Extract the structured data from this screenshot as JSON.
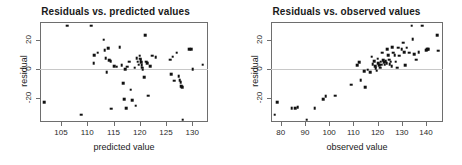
{
  "figure": {
    "background": "#ffffff",
    "point_color": "#111111",
    "frame_color": "#6e6e6e",
    "zero_line_color": "#c8c8c8"
  },
  "chart_data": [
    {
      "type": "scatter",
      "title": "Residuals vs. predicted values",
      "xlabel": "predicted value",
      "ylabel": "residual",
      "xlim": [
        101,
        133
      ],
      "ylim": [
        -36,
        32
      ],
      "xticks": [
        105,
        110,
        115,
        120,
        125,
        130
      ],
      "yticks": [
        20,
        0,
        -20
      ],
      "grid": false,
      "legend": "none",
      "annotations": [
        "horizontal reference line at residual = 0"
      ],
      "x": [
        101.8,
        106.2,
        108.9,
        110.8,
        111.2,
        111.3,
        112.0,
        113.1,
        113.3,
        113.5,
        113.7,
        114.0,
        114.2,
        114.5,
        114.6,
        115.1,
        115.6,
        116.2,
        116.6,
        116.8,
        117.0,
        117.2,
        117.4,
        117.6,
        118.0,
        118.3,
        118.6,
        119.0,
        119.2,
        119.4,
        119.6,
        119.8,
        120.0,
        120.1,
        120.2,
        120.3,
        120.4,
        120.5,
        120.6,
        120.8,
        121.0,
        121.2,
        121.4,
        121.6,
        122.0,
        122.4,
        123.0,
        125.8,
        126.0,
        126.3,
        126.6,
        127.0,
        127.4,
        127.6,
        127.8,
        127.9,
        128.0,
        128.1,
        128.2,
        129.4,
        129.8,
        130.1,
        132.0
      ],
      "y": [
        -22.5,
        29.5,
        -31.0,
        29.5,
        4.0,
        9.5,
        11.0,
        20.0,
        13.0,
        7.5,
        -2.0,
        14.0,
        6.0,
        5.5,
        -27.0,
        2.0,
        1.5,
        15.0,
        2.5,
        -9.5,
        -20.5,
        0.0,
        -26.5,
        1.5,
        5.0,
        -14.0,
        -21.0,
        1.0,
        -25.0,
        7.5,
        5.0,
        3.0,
        9.0,
        7.0,
        6.0,
        4.5,
        2.5,
        1.0,
        -0.5,
        -5.5,
        23.0,
        5.0,
        4.0,
        -18.0,
        2.0,
        9.0,
        8.0,
        6.5,
        -3.5,
        8.5,
        -8.0,
        11.0,
        -5.0,
        -7.5,
        -9.0,
        -11.5,
        -12.0,
        -12.5,
        -34.5,
        13.5,
        13.5,
        0.0,
        3.0
      ]
    },
    {
      "type": "scatter",
      "title": "Residuals vs. observed values",
      "xlabel": "observed value",
      "ylabel": "residual",
      "xlim": [
        76,
        147
      ],
      "ylim": [
        -36,
        32
      ],
      "xticks": [
        80,
        90,
        100,
        110,
        120,
        130,
        140
      ],
      "yticks": [
        20,
        0,
        -20
      ],
      "grid": false,
      "legend": "none",
      "annotations": [
        "horizontal reference line at residual = 0"
      ],
      "x": [
        77.5,
        78.5,
        84.5,
        86.0,
        87.0,
        90.8,
        94.0,
        97.5,
        98.5,
        102.5,
        109.0,
        111.5,
        112.5,
        113.0,
        114.5,
        115.0,
        116.0,
        117.0,
        117.5,
        118.0,
        118.5,
        119.0,
        119.3,
        119.6,
        120.0,
        120.3,
        120.6,
        121.0,
        121.3,
        121.6,
        122.0,
        122.4,
        122.8,
        123.0,
        123.4,
        123.8,
        124.0,
        124.4,
        124.8,
        125.0,
        125.4,
        125.8,
        126.0,
        126.5,
        127.0,
        127.5,
        128.0,
        128.5,
        129.0,
        130.0,
        130.5,
        131.0,
        131.5,
        132.0,
        133.0,
        134.0,
        134.5,
        135.0,
        136.0,
        137.0,
        138.5,
        140.0,
        140.5,
        141.0,
        144.5,
        145.0
      ],
      "y": [
        -31.0,
        -22.5,
        -26.5,
        -26.5,
        -26.0,
        -34.5,
        -26.5,
        -20.5,
        -18.5,
        -18.0,
        -10.5,
        2.5,
        4.5,
        -7.5,
        -1.5,
        -12.5,
        -0.5,
        -2.0,
        8.5,
        3.5,
        5.5,
        2.0,
        0.5,
        -1.0,
        7.0,
        4.0,
        2.5,
        1.0,
        5.0,
        3.0,
        11.0,
        6.0,
        4.5,
        3.0,
        5.5,
        4.0,
        13.5,
        9.5,
        6.5,
        3.5,
        5.0,
        2.0,
        15.0,
        11.0,
        9.5,
        5.0,
        1.0,
        14.5,
        9.0,
        13.5,
        18.0,
        11.5,
        2.5,
        14.5,
        11.0,
        29.5,
        20.5,
        10.0,
        6.5,
        11.5,
        29.5,
        13.0,
        13.5,
        13.5,
        23.0,
        12.5
      ]
    }
  ]
}
